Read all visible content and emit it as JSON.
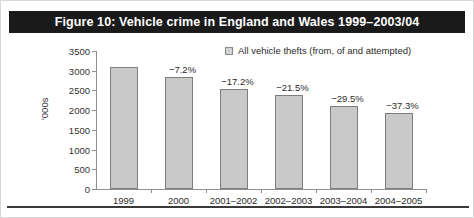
{
  "title": "Figure 10: Vehicle crime in England and Wales 1999–2003/04",
  "legend": {
    "label": "All vehicle thefts (from, of and attempted)",
    "swatch_name": "legend-swatch-all-vehicle-thefts"
  },
  "colors": {
    "title_bar_background": "#1a1a1a",
    "title_text": "#ffffff",
    "bar_fill": "#c9c9c9",
    "bar_border": "#7d7d7d",
    "axis": "#8f8f8f",
    "text": "#2b2b2b",
    "bottom_rule": "#3a3a3a",
    "page_background": "#ffffff"
  },
  "chart_data": {
    "type": "bar",
    "title": "Figure 10: Vehicle crime in England and Wales 1999–2003/04",
    "xlabel": "",
    "ylabel": "'000s",
    "categories": [
      "1999",
      "2000",
      "2001–2002",
      "2002–2003",
      "2003–2004",
      "2004–2005"
    ],
    "values": [
      3090,
      2840,
      2535,
      2385,
      2105,
      1930
    ],
    "data_labels": [
      "",
      "−7.2%",
      "−17.2%",
      "−21.5%",
      "−29.5%",
      "−37.3%"
    ],
    "series": [
      {
        "name": "All vehicle thefts (from, of and attempted)",
        "values": [
          3090,
          2840,
          2535,
          2385,
          2105,
          1930
        ]
      }
    ],
    "ylim": [
      0,
      3500
    ],
    "yticks": [
      0,
      500,
      1000,
      1500,
      2000,
      2500,
      3000,
      3500
    ],
    "ytick_labels": [
      "0",
      "500",
      "1000",
      "1500",
      "2000",
      "2500",
      "3000",
      "3500"
    ],
    "grid": false,
    "legend_position": "top-right"
  }
}
